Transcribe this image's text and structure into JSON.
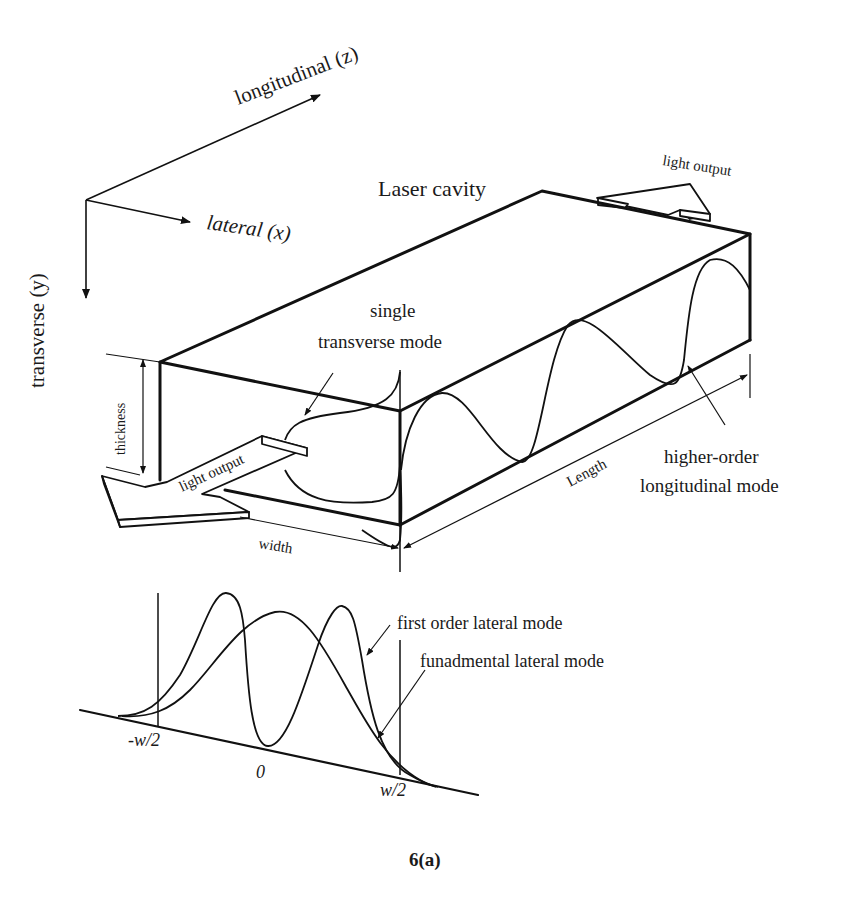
{
  "figure": {
    "caption": "6(a)",
    "title": "Laser cavity"
  },
  "axes": {
    "longitudinal": "longitudinal (z)",
    "lateral": "lateral (x)",
    "transverse": "transverse (y)"
  },
  "cavity": {
    "label": "Laser cavity",
    "dimensions": {
      "thickness": "thickness",
      "width": "width",
      "length": "Length"
    },
    "outputs": {
      "front": "light output",
      "back": "light output"
    },
    "modes": {
      "transverse_line1": "single",
      "transverse_line2": "transverse mode",
      "longitudinal_line1": "higher-order",
      "longitudinal_line2": "longitudinal mode"
    }
  },
  "lateral_profile": {
    "first_order": "first order lateral mode",
    "fundamental": "funadmental lateral mode",
    "ticks": {
      "neg": "-w/2",
      "zero": "0",
      "pos": "w/2"
    }
  },
  "colors": {
    "line": "#111111",
    "background": "#ffffff"
  }
}
